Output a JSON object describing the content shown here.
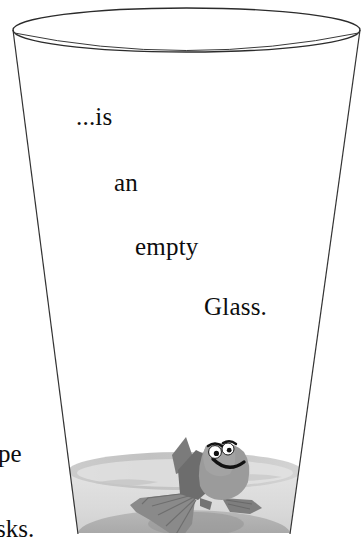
{
  "image": {
    "kind": "cartoon-illustration",
    "subject": "tall tapered drinking glass containing a small amount of water and a cartoon fish",
    "background_color": "#ffffff"
  },
  "caption": {
    "full_text": "...is an empty Glass.",
    "words": [
      {
        "id": "is",
        "text": "...is"
      },
      {
        "id": "an",
        "text": "an"
      },
      {
        "id": "empty",
        "text": "empty"
      },
      {
        "id": "glass",
        "text": "Glass."
      }
    ],
    "text_color": "#0d0d0d"
  },
  "clipped_edge_text": [
    {
      "id": "pe",
      "text": "pe"
    },
    {
      "id": "sks",
      "text": "sks."
    }
  ],
  "glass": {
    "outline_color": "#333333",
    "outline_width": 1.2,
    "fill_color": "#ffffff",
    "rim_label": "glass-rim-ellipse",
    "base_label": "glass-base-ellipse"
  },
  "water": {
    "body_color": "#dcdcdc",
    "surface_color": "#c9c9c9",
    "surface_highlight_color": "#e6e6e6",
    "base_shadow_color": "#a8a8a8"
  },
  "fish": {
    "body_color": "#9a9a9a",
    "body_dark_color": "#6f6f6f",
    "fin_color": "#7e7e7e",
    "tail_color": "#888888",
    "eye_white": "#ffffff",
    "pupil_color": "#111111",
    "mouth_color": "#111111",
    "eye_count": 2,
    "expression": "smiling"
  }
}
